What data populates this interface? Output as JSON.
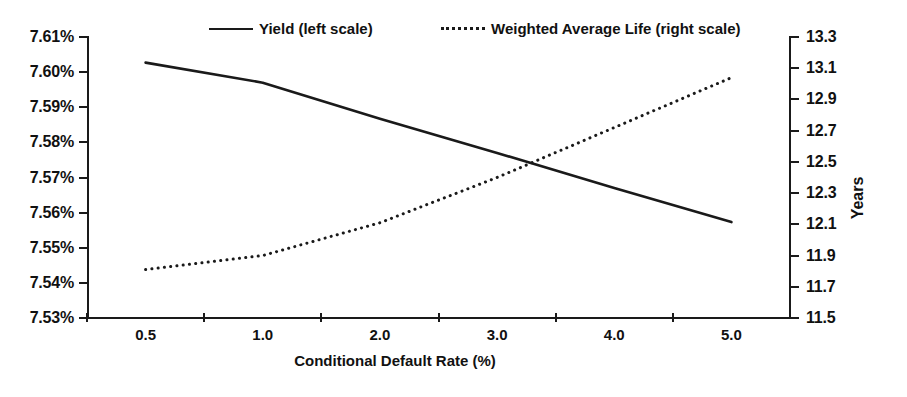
{
  "chart_data": {
    "type": "line",
    "title": "",
    "xlabel": "Conditional Default Rate (%)",
    "ylabel": "",
    "ylabel_right": "Years",
    "categories": [
      "0.5",
      "1.0",
      "2.0",
      "3.0",
      "4.0",
      "5.0"
    ],
    "x_tick_labels": [
      "0.5",
      "1.0",
      "2.0",
      "3.0",
      "4.0",
      "5.0"
    ],
    "y_tick_labels_left": [
      "7.61%",
      "7.60%",
      "7.59%",
      "7.58%",
      "7.57%",
      "7.56%",
      "7.55%",
      "7.54%",
      "7.53%"
    ],
    "y_tick_values_left": [
      7.61,
      7.6,
      7.59,
      7.58,
      7.57,
      7.56,
      7.55,
      7.54,
      7.53
    ],
    "y_tick_labels_right": [
      "13.3",
      "13.1",
      "12.9",
      "12.7",
      "12.5",
      "12.3",
      "12.1",
      "11.9",
      "11.7",
      "11.5"
    ],
    "y_tick_values_right": [
      13.3,
      13.1,
      12.9,
      12.7,
      12.5,
      12.3,
      12.1,
      11.9,
      11.7,
      11.5
    ],
    "ylim_left": [
      7.53,
      7.61
    ],
    "ylim_right": [
      11.5,
      13.3
    ],
    "grid": false,
    "legend_position": "top",
    "series": [
      {
        "name": "Yield (left scale)",
        "axis": "left",
        "style": "solid",
        "color": "#1a1a1a",
        "values": [
          7.6027,
          7.597,
          7.5867,
          7.577,
          7.567,
          7.5573
        ]
      },
      {
        "name": "Weighted Average Life (right scale)",
        "axis": "right",
        "style": "dotted",
        "color": "#1a1a1a",
        "values": [
          11.81,
          11.9,
          12.11,
          12.4,
          12.72,
          13.04
        ]
      }
    ]
  },
  "legend": {
    "yield_label": "Yield (left scale)",
    "wal_label": "Weighted Average Life (right scale)"
  },
  "axes": {
    "x_title": "Conditional Default Rate (%)",
    "y_right_title": "Years"
  }
}
